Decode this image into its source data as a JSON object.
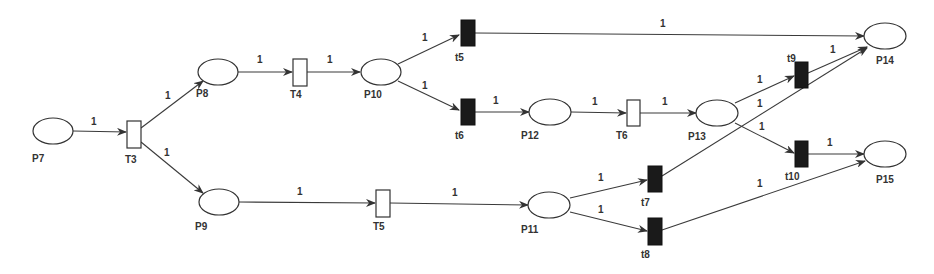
{
  "diagram": {
    "type": "petri-net",
    "places": [
      {
        "id": "P7",
        "label": "P7"
      },
      {
        "id": "P8",
        "label": "P8"
      },
      {
        "id": "P9",
        "label": "P9"
      },
      {
        "id": "P10",
        "label": "P10"
      },
      {
        "id": "P11",
        "label": "P11"
      },
      {
        "id": "P12",
        "label": "P12"
      },
      {
        "id": "P13",
        "label": "P13"
      },
      {
        "id": "P14",
        "label": "P14"
      },
      {
        "id": "P15",
        "label": "P15"
      }
    ],
    "transitions": [
      {
        "id": "T3",
        "label": "T3",
        "style": "hollow"
      },
      {
        "id": "T4",
        "label": "T4",
        "style": "hollow"
      },
      {
        "id": "T5",
        "label": "T5",
        "style": "hollow"
      },
      {
        "id": "T6",
        "label": "T6",
        "style": "hollow"
      },
      {
        "id": "t5",
        "label": "t5",
        "style": "solid"
      },
      {
        "id": "t6",
        "label": "t6",
        "style": "solid"
      },
      {
        "id": "t7",
        "label": "t7",
        "style": "solid"
      },
      {
        "id": "t8",
        "label": "t8",
        "style": "solid"
      },
      {
        "id": "t9",
        "label": "t9",
        "style": "solid"
      },
      {
        "id": "t10",
        "label": "t10",
        "style": "solid"
      }
    ],
    "arcs": [
      {
        "from": "P7",
        "to": "T3",
        "weight": "1"
      },
      {
        "from": "T3",
        "to": "P8",
        "weight": "1"
      },
      {
        "from": "T3",
        "to": "P9",
        "weight": "1"
      },
      {
        "from": "P8",
        "to": "T4",
        "weight": "1"
      },
      {
        "from": "T4",
        "to": "P10",
        "weight": "1"
      },
      {
        "from": "P10",
        "to": "t5",
        "weight": "1"
      },
      {
        "from": "P10",
        "to": "t6",
        "weight": "1"
      },
      {
        "from": "t5",
        "to": "P14",
        "weight": "1"
      },
      {
        "from": "t6",
        "to": "P12",
        "weight": "1"
      },
      {
        "from": "P12",
        "to": "T6",
        "weight": "1"
      },
      {
        "from": "T6",
        "to": "P13",
        "weight": "1"
      },
      {
        "from": "P13",
        "to": "t9",
        "weight": "1"
      },
      {
        "from": "P13",
        "to": "t10",
        "weight": "1"
      },
      {
        "from": "t9",
        "to": "P14",
        "weight": "1"
      },
      {
        "from": "t10",
        "to": "P15",
        "weight": "1"
      },
      {
        "from": "P9",
        "to": "T5",
        "weight": "1"
      },
      {
        "from": "T5",
        "to": "P11",
        "weight": "1"
      },
      {
        "from": "P11",
        "to": "t7",
        "weight": "1"
      },
      {
        "from": "P11",
        "to": "t8",
        "weight": "1"
      },
      {
        "from": "t7",
        "to": "P14",
        "weight": "1"
      },
      {
        "from": "t8",
        "to": "P15",
        "weight": "1"
      }
    ]
  }
}
